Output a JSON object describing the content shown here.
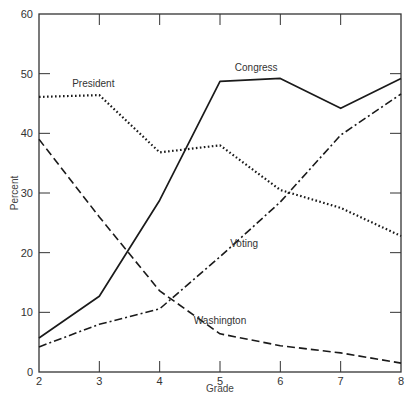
{
  "chart_data": {
    "type": "line",
    "title": "",
    "xlabel": "Grade",
    "ylabel": "Percent",
    "x": [
      2,
      3,
      4,
      5,
      6,
      7,
      8
    ],
    "xlim": [
      2,
      8
    ],
    "ylim": [
      0,
      60
    ],
    "yticks": [
      0,
      10,
      20,
      30,
      40,
      50,
      60
    ],
    "xticks": [
      2,
      3,
      4,
      5,
      6,
      7,
      8
    ],
    "grid": false,
    "legend": "inline labels",
    "series": [
      {
        "name": "Congress",
        "style": "solid",
        "values": [
          5.7,
          12.7,
          28.8,
          48.7,
          49.2,
          44.2,
          49.2
        ]
      },
      {
        "name": "President",
        "style": "dotted",
        "values": [
          46.1,
          46.4,
          36.8,
          38.0,
          30.5,
          27.5,
          22.8
        ]
      },
      {
        "name": "Voting",
        "style": "dash-dot",
        "values": [
          4.2,
          8.0,
          10.6,
          19.3,
          28.5,
          39.7,
          46.6
        ]
      },
      {
        "name": "Washington",
        "style": "dashed",
        "values": [
          39.0,
          26.0,
          13.6,
          6.4,
          4.4,
          3.2,
          1.5
        ]
      }
    ],
    "annotations": [
      {
        "text": "Congress",
        "x": 5.6,
        "y": 50.5
      },
      {
        "text": "President",
        "x": 2.9,
        "y": 47.7
      },
      {
        "text": "Voting",
        "x": 5.4,
        "y": 21.0
      },
      {
        "text": "Washington",
        "x": 5.0,
        "y": 8.0
      }
    ]
  },
  "colors": {
    "line": "#1a1a1a",
    "axis": "#333333",
    "text": "#333333"
  }
}
